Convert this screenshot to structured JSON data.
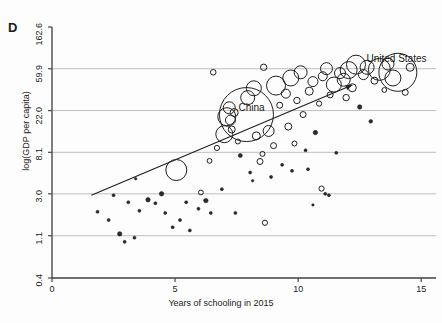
{
  "figure": {
    "panel_label": "D",
    "ylabel": "log(GDP per capita)",
    "xlabel": "Years of schooling in 2015"
  },
  "chart_data": {
    "type": "scatter",
    "title": "",
    "subtitle": "",
    "panel": "D",
    "xlabel": "Years of schooling in 2015",
    "ylabel": "log(GDP per capita)",
    "xlim": [
      0,
      15.6
    ],
    "ylim": [
      0.4,
      162.6
    ],
    "y_scale": "log",
    "grid": "horizontal",
    "legend": "none",
    "xticks": [
      0,
      5,
      10,
      15
    ],
    "xtick_labels": [
      "0",
      "5",
      "10",
      "15"
    ],
    "yticks": [
      0.4,
      1.1,
      3.0,
      8.1,
      22.0,
      59.9,
      162.6
    ],
    "ytick_labels": [
      "0.4",
      "1.1",
      "3.0",
      "8.1",
      "22.0",
      "59.9",
      "162.6"
    ],
    "marker_style": "open circles sized by population (bubble)",
    "annotations": [
      {
        "text": "China",
        "x": 7.9,
        "y": 22.6
      },
      {
        "text": "United States",
        "x": 13.1,
        "y": 74.0
      }
    ],
    "trend_line": {
      "type": "fitted-line-with-arrow",
      "x_start": 1.6,
      "y_start": 2.9,
      "x_end": 12.2,
      "y_end": 40.5,
      "arrow_at": "end"
    },
    "points": [
      {
        "x": 1.85,
        "y": 1.95,
        "size": 1.5
      },
      {
        "x": 2.3,
        "y": 1.6,
        "size": 1.5
      },
      {
        "x": 2.5,
        "y": 2.9,
        "size": 1.5
      },
      {
        "x": 2.75,
        "y": 1.15,
        "size": 2.2
      },
      {
        "x": 2.95,
        "y": 0.95,
        "size": 1.5
      },
      {
        "x": 3.1,
        "y": 2.45,
        "size": 1.5
      },
      {
        "x": 3.35,
        "y": 1.05,
        "size": 1.5
      },
      {
        "x": 3.4,
        "y": 4.3,
        "size": 1.2
      },
      {
        "x": 3.55,
        "y": 2.0,
        "size": 1.5
      },
      {
        "x": 3.9,
        "y": 2.6,
        "size": 2.2
      },
      {
        "x": 4.2,
        "y": 2.4,
        "size": 1.5
      },
      {
        "x": 4.45,
        "y": 3.0,
        "size": 2.2
      },
      {
        "x": 4.6,
        "y": 1.9,
        "size": 1.5
      },
      {
        "x": 4.9,
        "y": 1.35,
        "size": 1.5
      },
      {
        "x": 5.05,
        "y": 5.3,
        "size": 10.5
      },
      {
        "x": 5.2,
        "y": 1.6,
        "size": 1.5
      },
      {
        "x": 5.45,
        "y": 2.45,
        "size": 1.5
      },
      {
        "x": 5.6,
        "y": 1.25,
        "size": 1.5
      },
      {
        "x": 5.95,
        "y": 2.1,
        "size": 1.5
      },
      {
        "x": 6.05,
        "y": 3.1,
        "size": 2.4
      },
      {
        "x": 6.25,
        "y": 2.55,
        "size": 2.2
      },
      {
        "x": 6.4,
        "y": 6.6,
        "size": 2.4
      },
      {
        "x": 6.45,
        "y": 1.9,
        "size": 1.5
      },
      {
        "x": 6.7,
        "y": 9.0,
        "size": 2.6
      },
      {
        "x": 6.9,
        "y": 3.35,
        "size": 1.5
      },
      {
        "x": 7.0,
        "y": 12.5,
        "size": 8.5
      },
      {
        "x": 7.1,
        "y": 19.0,
        "size": 9.0
      },
      {
        "x": 7.2,
        "y": 23.5,
        "size": 6.0
      },
      {
        "x": 7.25,
        "y": 17.5,
        "size": 5.0
      },
      {
        "x": 7.3,
        "y": 14.0,
        "size": 3.5
      },
      {
        "x": 7.4,
        "y": 21.0,
        "size": 4.0
      },
      {
        "x": 7.55,
        "y": 10.5,
        "size": 2.5
      },
      {
        "x": 7.65,
        "y": 7.5,
        "size": 2.0
      },
      {
        "x": 7.9,
        "y": 20.0,
        "size": 27.0
      },
      {
        "x": 7.95,
        "y": 30.0,
        "size": 7.0
      },
      {
        "x": 8.05,
        "y": 5.0,
        "size": 1.5
      },
      {
        "x": 8.2,
        "y": 37.5,
        "size": 7.5
      },
      {
        "x": 8.3,
        "y": 12.0,
        "size": 4.0
      },
      {
        "x": 8.45,
        "y": 6.5,
        "size": 3.0
      },
      {
        "x": 8.55,
        "y": 7.8,
        "size": 2.5
      },
      {
        "x": 8.6,
        "y": 62.0,
        "size": 3.2
      },
      {
        "x": 8.8,
        "y": 13.5,
        "size": 5.5
      },
      {
        "x": 8.9,
        "y": 4.5,
        "size": 1.5
      },
      {
        "x": 9.0,
        "y": 9.5,
        "size": 3.0
      },
      {
        "x": 9.1,
        "y": 40.0,
        "size": 9.5
      },
      {
        "x": 9.25,
        "y": 25.0,
        "size": 3.0
      },
      {
        "x": 9.35,
        "y": 6.0,
        "size": 1.5
      },
      {
        "x": 9.5,
        "y": 33.0,
        "size": 4.5
      },
      {
        "x": 9.6,
        "y": 15.0,
        "size": 3.5
      },
      {
        "x": 9.7,
        "y": 48.0,
        "size": 8.0
      },
      {
        "x": 9.85,
        "y": 10.0,
        "size": 2.5
      },
      {
        "x": 9.95,
        "y": 28.0,
        "size": 3.2
      },
      {
        "x": 10.1,
        "y": 55.0,
        "size": 6.5
      },
      {
        "x": 10.2,
        "y": 20.0,
        "size": 3.0
      },
      {
        "x": 10.3,
        "y": 8.5,
        "size": 1.5
      },
      {
        "x": 10.45,
        "y": 35.0,
        "size": 4.0
      },
      {
        "x": 10.6,
        "y": 44.0,
        "size": 5.0
      },
      {
        "x": 10.7,
        "y": 13.0,
        "size": 2.2
      },
      {
        "x": 10.85,
        "y": 26.0,
        "size": 2.6
      },
      {
        "x": 11.0,
        "y": 50.0,
        "size": 4.5
      },
      {
        "x": 11.15,
        "y": 60.0,
        "size": 6.0
      },
      {
        "x": 11.3,
        "y": 32.0,
        "size": 3.0
      },
      {
        "x": 11.45,
        "y": 41.0,
        "size": 7.5
      },
      {
        "x": 11.55,
        "y": 8.0,
        "size": 1.5
      },
      {
        "x": 11.7,
        "y": 54.0,
        "size": 5.5
      },
      {
        "x": 11.85,
        "y": 46.0,
        "size": 6.5
      },
      {
        "x": 11.95,
        "y": 30.0,
        "size": 3.2
      },
      {
        "x": 12.05,
        "y": 58.0,
        "size": 8.5
      },
      {
        "x": 12.2,
        "y": 38.0,
        "size": 4.0
      },
      {
        "x": 12.35,
        "y": 66.0,
        "size": 9.5
      },
      {
        "x": 12.5,
        "y": 24.0,
        "size": 2.2
      },
      {
        "x": 12.65,
        "y": 52.0,
        "size": 5.0
      },
      {
        "x": 12.8,
        "y": 62.0,
        "size": 7.0
      },
      {
        "x": 12.95,
        "y": 17.0,
        "size": 1.8
      },
      {
        "x": 13.1,
        "y": 45.0,
        "size": 3.5
      },
      {
        "x": 13.3,
        "y": 59.0,
        "size": 11.0
      },
      {
        "x": 13.5,
        "y": 36.0,
        "size": 2.4
      },
      {
        "x": 13.65,
        "y": 67.0,
        "size": 6.0
      },
      {
        "x": 13.85,
        "y": 48.0,
        "size": 8.0
      },
      {
        "x": 14.05,
        "y": 55.0,
        "size": 19.0
      },
      {
        "x": 14.35,
        "y": 34.0,
        "size": 3.0
      },
      {
        "x": 14.55,
        "y": 62.0,
        "size": 4.0
      },
      {
        "x": 10.95,
        "y": 3.4,
        "size": 2.6
      },
      {
        "x": 11.25,
        "y": 2.9,
        "size": 1.5
      },
      {
        "x": 10.6,
        "y": 2.3,
        "size": 1.2
      },
      {
        "x": 11.1,
        "y": 3.0,
        "size": 1.5
      },
      {
        "x": 9.75,
        "y": 5.2,
        "size": 1.5
      },
      {
        "x": 10.4,
        "y": 5.4,
        "size": 1.5
      },
      {
        "x": 6.55,
        "y": 55.0,
        "size": 2.8
      },
      {
        "x": 8.15,
        "y": 4.1,
        "size": 1.2
      },
      {
        "x": 7.45,
        "y": 1.9,
        "size": 1.5
      },
      {
        "x": 8.65,
        "y": 1.5,
        "size": 2.6
      }
    ]
  }
}
